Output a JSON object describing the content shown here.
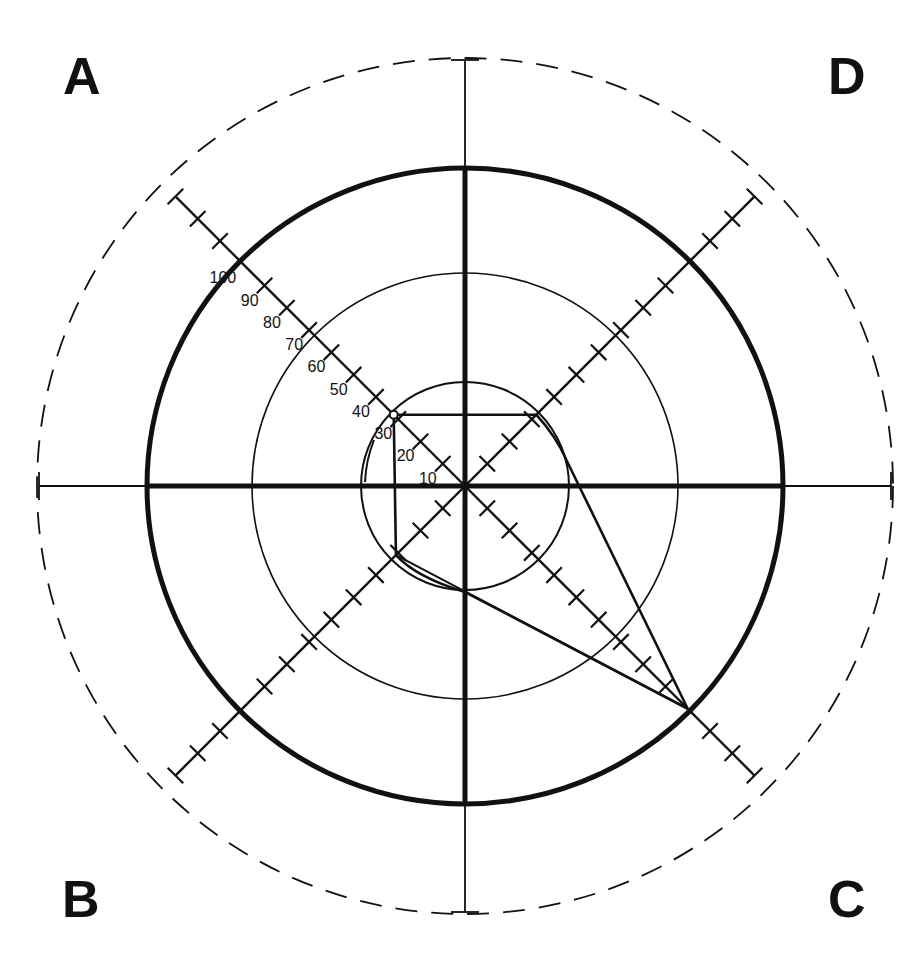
{
  "corners": {
    "top_left": "A",
    "bottom_left": "B",
    "bottom_right": "C",
    "top_right": "D"
  },
  "scale": {
    "labels": [
      "10",
      "20",
      "30",
      "40",
      "50",
      "60",
      "70",
      "80",
      "90",
      "100"
    ]
  },
  "geometry": {
    "center": [
      465,
      486
    ],
    "units_per_10": 31.5,
    "circles": [
      {
        "name": "inner",
        "radius": 104,
        "stroke": 2
      },
      {
        "name": "middle",
        "radius": 213,
        "stroke": 1.6
      },
      {
        "name": "thick",
        "radius": 318,
        "stroke": 5
      },
      {
        "name": "outer-dashed",
        "radius": 428,
        "stroke": 1.8,
        "dashed": true
      }
    ]
  },
  "chart_data": {
    "type": "radar",
    "title": "",
    "axes": [
      "A",
      "D",
      "C",
      "B"
    ],
    "scale_range": [
      0,
      100
    ],
    "tick_step": 10,
    "reference_rings": [
      33,
      67,
      100,
      135
    ],
    "series": [
      {
        "name": "profile",
        "values": {
          "A": 32,
          "D": 32,
          "C": 100,
          "B": 31
        }
      }
    ],
    "colors": {
      "ink": "#111111",
      "background": "#ffffff"
    }
  }
}
